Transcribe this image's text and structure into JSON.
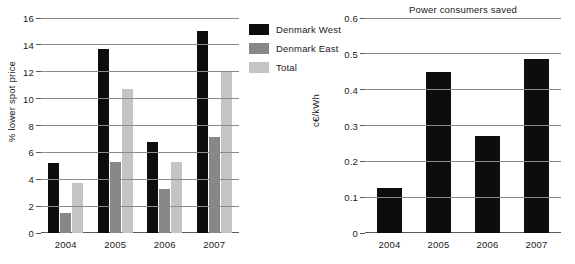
{
  "chart_data": [
    {
      "id": "spot-price-chart",
      "type": "bar",
      "title": "",
      "xlabel": "",
      "ylabel": "% lower spot price",
      "categories": [
        "2004",
        "2005",
        "2006",
        "2007"
      ],
      "ylim": [
        0,
        16
      ],
      "yticks": [
        0,
        2,
        4,
        6,
        8,
        10,
        12,
        14,
        16
      ],
      "ytick_labels": [
        "0",
        "2",
        "4",
        "6",
        "8",
        "10",
        "12",
        "14",
        "16"
      ],
      "grid": true,
      "legend_position": "right",
      "series": [
        {
          "name": "Denmark West",
          "color": "#0d0d0d",
          "values": [
            5.2,
            13.7,
            6.8,
            15.0
          ]
        },
        {
          "name": "Denmark East",
          "color": "#878787",
          "values": [
            1.5,
            5.25,
            3.25,
            7.15
          ]
        },
        {
          "name": "Total",
          "color": "#c4c4c4",
          "values": [
            3.7,
            10.75,
            5.3,
            12.0
          ]
        }
      ]
    },
    {
      "id": "power-consumers-saved-chart",
      "type": "bar",
      "title": "Power consumers saved",
      "xlabel": "",
      "ylabel": "c€/kWh",
      "categories": [
        "2004",
        "2005",
        "2006",
        "2007"
      ],
      "ylim": [
        0,
        0.6
      ],
      "yticks": [
        0,
        0.1,
        0.2,
        0.3,
        0.4,
        0.5,
        0.6
      ],
      "ytick_labels": [
        "0",
        "0.1",
        "0.2",
        "0.3",
        "0.4",
        "0.5",
        "0.6"
      ],
      "grid": true,
      "legend_position": "none",
      "series": [
        {
          "name": "Power consumers saved",
          "color": "#0d0d0d",
          "values": [
            0.125,
            0.45,
            0.27,
            0.485
          ]
        }
      ]
    }
  ],
  "legend": {
    "items": [
      {
        "label": "Denmark West",
        "color": "#0d0d0d"
      },
      {
        "label": "Denmark East",
        "color": "#878787"
      },
      {
        "label": "Total",
        "color": "#c4c4c4"
      }
    ]
  }
}
